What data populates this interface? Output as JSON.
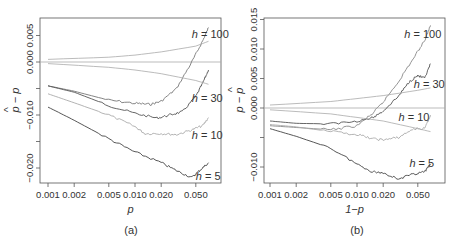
{
  "chart_data": [
    {
      "type": "line",
      "panel_label": "(a)",
      "xlabel": "p",
      "ylabel": "p − p̂",
      "xscale": "log",
      "xticks": [
        0.001,
        0.002,
        0.005,
        0.01,
        0.02,
        0.05
      ],
      "xtick_labels": [
        "0.001",
        "0.002",
        "0.005",
        "0.010",
        "0.020",
        "0.050"
      ],
      "yticks": [
        0.005,
        0.0,
        -0.005,
        -0.01,
        -0.015,
        -0.02
      ],
      "ytick_labels": [
        "0.005",
        "0.000",
        "",
        "-0.010",
        "",
        "-0.020"
      ],
      "xlim": [
        0.001,
        0.07
      ],
      "ylim": [
        -0.0225,
        0.0085
      ],
      "grid": false,
      "reference_line": 0.0,
      "series": [
        {
          "name": "h = 100",
          "color": "#777777",
          "x": [
            0.001,
            0.002,
            0.005,
            0.01,
            0.015,
            0.02,
            0.03,
            0.045,
            0.06,
            0.07
          ],
          "y": [
            -0.0045,
            -0.0055,
            -0.0072,
            -0.0078,
            -0.008,
            -0.0074,
            -0.005,
            0.0,
            0.004,
            0.0065
          ]
        },
        {
          "name": "h = 30",
          "color": "#555555",
          "x": [
            0.001,
            0.002,
            0.005,
            0.01,
            0.018,
            0.025,
            0.035,
            0.05,
            0.06,
            0.07
          ],
          "y": [
            -0.0045,
            -0.0057,
            -0.0082,
            -0.0097,
            -0.0106,
            -0.01,
            -0.0094,
            -0.0065,
            -0.004,
            -0.0015
          ]
        },
        {
          "name": "h = 10",
          "color": "#aaaaaa",
          "x": [
            0.001,
            0.002,
            0.005,
            0.01,
            0.013,
            0.02,
            0.03,
            0.045,
            0.06,
            0.07
          ],
          "y": [
            -0.006,
            -0.0077,
            -0.01,
            -0.0122,
            -0.0135,
            -0.0135,
            -0.0137,
            -0.0128,
            -0.012,
            -0.0105
          ]
        },
        {
          "name": "h = 5",
          "color": "#444444",
          "x": [
            0.001,
            0.002,
            0.005,
            0.01,
            0.02,
            0.03,
            0.045,
            0.055,
            0.07
          ],
          "y": [
            -0.0085,
            -0.011,
            -0.0145,
            -0.017,
            -0.019,
            -0.0205,
            -0.0218,
            -0.0205,
            -0.019
          ]
        },
        {
          "name": "trend-upper",
          "color": "#aaaaaa",
          "x": [
            0.001,
            0.005,
            0.01,
            0.02,
            0.05,
            0.07
          ],
          "y": [
            0.0005,
            0.0009,
            0.0013,
            0.0019,
            0.003,
            0.0039
          ]
        },
        {
          "name": "trend-lower",
          "color": "#aaaaaa",
          "x": [
            0.001,
            0.005,
            0.01,
            0.02,
            0.05,
            0.07
          ],
          "y": [
            -0.0003,
            -0.001,
            -0.0015,
            -0.0022,
            -0.0035,
            -0.0042
          ]
        }
      ],
      "annotations": [
        {
          "text": "h = 100",
          "x": 0.045,
          "y": 0.0052
        },
        {
          "text": "h = 30",
          "x": 0.045,
          "y": -0.0068
        },
        {
          "text": "h = 10",
          "x": 0.045,
          "y": -0.0138
        },
        {
          "text": "h = 5",
          "x": 0.05,
          "y": -0.0216
        }
      ]
    },
    {
      "type": "line",
      "panel_label": "(b)",
      "xlabel": "1−p",
      "ylabel": "p̂ − p",
      "xscale": "log",
      "xticks": [
        0.001,
        0.002,
        0.005,
        0.01,
        0.02,
        0.05
      ],
      "xtick_labels": [
        "0.001",
        "0.002",
        "0.005",
        "0.010",
        "0.020",
        "0.050"
      ],
      "yticks": [
        0.015,
        0.01,
        0.005,
        0.0,
        -0.005,
        -0.01
      ],
      "ytick_labels": [
        "0.015",
        "0.010",
        "0.005",
        "0.000",
        "",
        "-0.010"
      ],
      "xlim": [
        0.001,
        0.07
      ],
      "ylim": [
        -0.013,
        0.0155
      ],
      "grid": false,
      "reference_line": 0.0,
      "series": [
        {
          "name": "h = 100",
          "color": "#888888",
          "x": [
            0.001,
            0.002,
            0.005,
            0.01,
            0.015,
            0.02,
            0.03,
            0.045,
            0.06,
            0.07
          ],
          "y": [
            -0.003,
            -0.0033,
            -0.0037,
            -0.003,
            -0.001,
            0.001,
            0.0045,
            0.0085,
            0.0115,
            0.014
          ]
        },
        {
          "name": "h = 30",
          "color": "#555555",
          "x": [
            0.001,
            0.002,
            0.005,
            0.01,
            0.015,
            0.02,
            0.03,
            0.04,
            0.05,
            0.06,
            0.07
          ],
          "y": [
            -0.0022,
            -0.0026,
            -0.0027,
            -0.0022,
            -0.0017,
            -0.0005,
            0.002,
            0.0045,
            0.0055,
            0.005,
            0.0075
          ]
        },
        {
          "name": "h = 10",
          "color": "#aaaaaa",
          "x": [
            0.001,
            0.002,
            0.005,
            0.01,
            0.015,
            0.02,
            0.03,
            0.045,
            0.06,
            0.07
          ],
          "y": [
            -0.0028,
            -0.0032,
            -0.004,
            -0.0045,
            -0.0052,
            -0.0054,
            -0.005,
            -0.0035,
            -0.0035,
            -0.0012
          ]
        },
        {
          "name": "h = 5",
          "color": "#444444",
          "x": [
            0.001,
            0.002,
            0.005,
            0.01,
            0.015,
            0.02,
            0.03,
            0.045,
            0.06,
            0.07
          ],
          "y": [
            -0.0035,
            -0.0048,
            -0.0068,
            -0.0095,
            -0.0108,
            -0.011,
            -0.012,
            -0.0112,
            -0.0108,
            -0.0095
          ]
        },
        {
          "name": "trend-upper",
          "color": "#aaaaaa",
          "x": [
            0.001,
            0.005,
            0.01,
            0.02,
            0.05,
            0.07
          ],
          "y": [
            0.0005,
            0.0011,
            0.0016,
            0.0021,
            0.003,
            0.0034
          ]
        },
        {
          "name": "trend-lower",
          "color": "#aaaaaa",
          "x": [
            0.001,
            0.005,
            0.01,
            0.02,
            0.05,
            0.07
          ],
          "y": [
            -0.0003,
            -0.001,
            -0.0016,
            -0.0022,
            -0.0035,
            -0.004
          ]
        }
      ],
      "annotations": [
        {
          "text": "h = 100",
          "x": 0.035,
          "y": 0.0125
        },
        {
          "text": "h = 30",
          "x": 0.045,
          "y": 0.004
        },
        {
          "text": "h = 10",
          "x": 0.03,
          "y": -0.0015
        },
        {
          "text": "h = 5",
          "x": 0.04,
          "y": -0.0093
        }
      ]
    }
  ],
  "figure": {
    "panels": [
      {
        "label": "(a)",
        "xlabel": "p",
        "ylabel_main": "p − p",
        "ylabel_hat": "^"
      },
      {
        "label": "(b)",
        "xlabel": "1−p",
        "ylabel_main": "p − p",
        "ylabel_hat": "^"
      }
    ]
  }
}
